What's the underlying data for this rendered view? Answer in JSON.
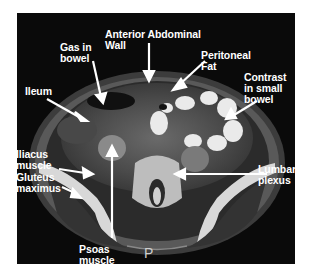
{
  "figure": {
    "type": "Axial CT scan of pelvis (labeled)",
    "orientation_marker": "P",
    "labels": [
      {
        "id": "anterior-abdominal-wall",
        "text": "Anterior Abdominal\nWall"
      },
      {
        "id": "gas-in-bowel",
        "text": "Gas in\nbowel"
      },
      {
        "id": "peritoneal-fat",
        "text": "Peritoneal\nFat"
      },
      {
        "id": "ileum",
        "text": "Ileum"
      },
      {
        "id": "contrast-in-small-bowel",
        "text": "Contrast\nin small\nbowel"
      },
      {
        "id": "iliacus-muscle",
        "text": "Iliacus\nmuscle"
      },
      {
        "id": "gluteus-maximus",
        "text": "Gluteus\nmaximus"
      },
      {
        "id": "lumbar-plexus",
        "text": "Lumbar\nplexus"
      },
      {
        "id": "psoas-muscle",
        "text": "Psoas\nmuscle"
      }
    ],
    "colors": {
      "background": "#0a0a0a",
      "label": "#ffffff",
      "page": "#ffffff"
    }
  }
}
